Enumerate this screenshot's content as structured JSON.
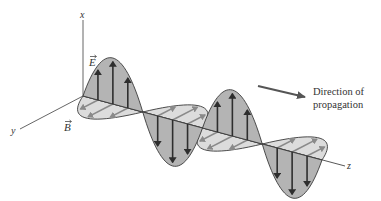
{
  "figure": {
    "axes": {
      "x_label": "x",
      "y_label": "y",
      "z_label": "z"
    },
    "vectors": {
      "electric_field_label": "E",
      "magnetic_field_label": "B"
    },
    "annotation": {
      "line1": "Direction of",
      "line2": "propagation"
    },
    "colors": {
      "e_lobe_fill": "#b4b4b4",
      "b_lobe_fill": "#dcdcdc",
      "e_arrow": "#2e2e2e",
      "b_arrow": "#8a8a8a",
      "outline": "#3a3a3a",
      "axis": "#555555",
      "direction_arrow": "#555555"
    },
    "geometry": {
      "origin": [
        83,
        96
      ],
      "half_wave": [
        59.75,
        16
      ],
      "half_waves": 4,
      "e_amplitude": 46,
      "b_amplitude": [
        -27,
        14
      ]
    }
  }
}
